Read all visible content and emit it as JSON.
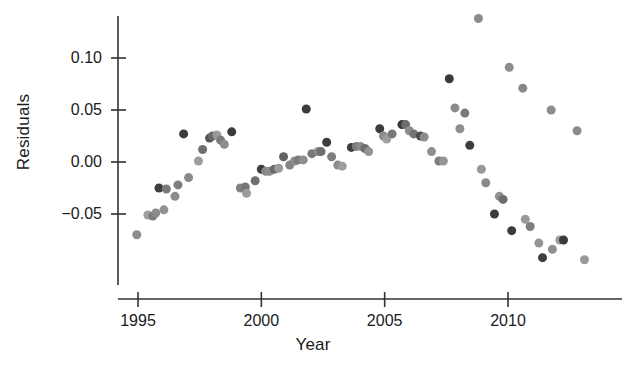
{
  "chart_data": {
    "type": "scatter",
    "title": "",
    "xlabel": "Year",
    "ylabel": "Residuals",
    "xlim": [
      1994.6,
      2013.7
    ],
    "ylim": [
      -0.098,
      0.145
    ],
    "grid": false,
    "legend": null,
    "xticks": [
      1995,
      2000,
      2005,
      2010
    ],
    "xtick_labels": [
      "1995",
      "2000",
      "2005",
      "2010"
    ],
    "yticks": [
      0.1,
      0.05,
      0.0,
      -0.05
    ],
    "ytick_labels": [
      "0.10",
      "0.05",
      "0.00",
      "-0.05"
    ],
    "marker": "circle",
    "marker_size_px": 9,
    "point_colors": [
      "#3b3b3b",
      "#6e6e6e",
      "#9a9a9a"
    ],
    "points": [
      {
        "x": 1994.95,
        "y": -0.07,
        "c": "#8d8d8d"
      },
      {
        "x": 1995.4,
        "y": -0.051,
        "c": "#9e9e9e"
      },
      {
        "x": 1995.6,
        "y": -0.052,
        "c": "#7d7d7d"
      },
      {
        "x": 1995.72,
        "y": -0.049,
        "c": "#8a8a8a"
      },
      {
        "x": 1996.05,
        "y": -0.046,
        "c": "#919191"
      },
      {
        "x": 1995.85,
        "y": -0.025,
        "c": "#3e3e3e"
      },
      {
        "x": 1996.15,
        "y": -0.026,
        "c": "#7a7a7a"
      },
      {
        "x": 1996.5,
        "y": -0.033,
        "c": "#8c8c8c"
      },
      {
        "x": 1996.62,
        "y": -0.022,
        "c": "#7d7d7d"
      },
      {
        "x": 1996.85,
        "y": 0.027,
        "c": "#3b3b3b"
      },
      {
        "x": 1997.05,
        "y": -0.015,
        "c": "#8a8a8a"
      },
      {
        "x": 1997.45,
        "y": 0.001,
        "c": "#9c9c9c"
      },
      {
        "x": 1997.62,
        "y": 0.012,
        "c": "#6f6f6f"
      },
      {
        "x": 1997.9,
        "y": 0.023,
        "c": "#555555"
      },
      {
        "x": 1998.02,
        "y": 0.025,
        "c": "#6a6a6a"
      },
      {
        "x": 1998.2,
        "y": 0.026,
        "c": "#9a9a9a"
      },
      {
        "x": 1998.35,
        "y": 0.021,
        "c": "#7b7b7b"
      },
      {
        "x": 1998.5,
        "y": 0.017,
        "c": "#8e8e8e"
      },
      {
        "x": 1998.8,
        "y": 0.029,
        "c": "#3c3c3c"
      },
      {
        "x": 1999.15,
        "y": -0.025,
        "c": "#828282"
      },
      {
        "x": 1999.35,
        "y": -0.024,
        "c": "#767676"
      },
      {
        "x": 1999.4,
        "y": -0.03,
        "c": "#9c9c9c"
      },
      {
        "x": 1999.75,
        "y": -0.018,
        "c": "#6e6e6e"
      },
      {
        "x": 2000.0,
        "y": -0.007,
        "c": "#3f3f3f"
      },
      {
        "x": 2000.18,
        "y": -0.009,
        "c": "#888888"
      },
      {
        "x": 2000.33,
        "y": -0.009,
        "c": "#8e8e8e"
      },
      {
        "x": 2000.52,
        "y": -0.007,
        "c": "#6a6a6a"
      },
      {
        "x": 2000.7,
        "y": -0.006,
        "c": "#9a9a9a"
      },
      {
        "x": 2000.9,
        "y": 0.005,
        "c": "#636363"
      },
      {
        "x": 2001.15,
        "y": -0.003,
        "c": "#848484"
      },
      {
        "x": 2001.35,
        "y": 0.001,
        "c": "#8d8d8d"
      },
      {
        "x": 2001.5,
        "y": 0.002,
        "c": "#7c7c7c"
      },
      {
        "x": 2001.7,
        "y": 0.002,
        "c": "#8f8f8f"
      },
      {
        "x": 2001.82,
        "y": 0.051,
        "c": "#3b3b3b"
      },
      {
        "x": 2002.05,
        "y": 0.008,
        "c": "#797979"
      },
      {
        "x": 2002.3,
        "y": 0.01,
        "c": "#8a8a8a"
      },
      {
        "x": 2002.42,
        "y": 0.01,
        "c": "#707070"
      },
      {
        "x": 2002.65,
        "y": 0.019,
        "c": "#3e3e3e"
      },
      {
        "x": 2002.85,
        "y": 0.005,
        "c": "#7f7f7f"
      },
      {
        "x": 2003.1,
        "y": -0.003,
        "c": "#8b8b8b"
      },
      {
        "x": 2003.28,
        "y": -0.004,
        "c": "#9d9d9d"
      },
      {
        "x": 2003.65,
        "y": 0.014,
        "c": "#3d3d3d"
      },
      {
        "x": 2003.85,
        "y": 0.015,
        "c": "#7b7b7b"
      },
      {
        "x": 2004.02,
        "y": 0.015,
        "c": "#8c8c8c"
      },
      {
        "x": 2004.2,
        "y": 0.013,
        "c": "#6d6d6d"
      },
      {
        "x": 2004.35,
        "y": 0.01,
        "c": "#949494"
      },
      {
        "x": 2004.8,
        "y": 0.032,
        "c": "#3c3c3c"
      },
      {
        "x": 2004.95,
        "y": 0.025,
        "c": "#8b8b8b"
      },
      {
        "x": 2005.08,
        "y": 0.022,
        "c": "#9e9e9e"
      },
      {
        "x": 2005.3,
        "y": 0.027,
        "c": "#787878"
      },
      {
        "x": 2005.7,
        "y": 0.036,
        "c": "#3b3b3b"
      },
      {
        "x": 2005.85,
        "y": 0.036,
        "c": "#6b6b6b"
      },
      {
        "x": 2006.0,
        "y": 0.03,
        "c": "#8d8d8d"
      },
      {
        "x": 2006.18,
        "y": 0.027,
        "c": "#747474"
      },
      {
        "x": 2006.45,
        "y": 0.025,
        "c": "#4c4c4c"
      },
      {
        "x": 2006.6,
        "y": 0.024,
        "c": "#8a8a8a"
      },
      {
        "x": 2006.9,
        "y": 0.01,
        "c": "#8f8f8f"
      },
      {
        "x": 2007.2,
        "y": 0.001,
        "c": "#7c7c7c"
      },
      {
        "x": 2007.38,
        "y": 0.001,
        "c": "#949494"
      },
      {
        "x": 2007.62,
        "y": 0.08,
        "c": "#3a3a3a"
      },
      {
        "x": 2007.85,
        "y": 0.052,
        "c": "#8b8b8b"
      },
      {
        "x": 2008.05,
        "y": 0.032,
        "c": "#8e8e8e"
      },
      {
        "x": 2008.25,
        "y": 0.047,
        "c": "#7a7a7a"
      },
      {
        "x": 2008.45,
        "y": 0.016,
        "c": "#3d3d3d"
      },
      {
        "x": 2008.8,
        "y": 0.138,
        "c": "#8c8c8c"
      },
      {
        "x": 2008.92,
        "y": -0.007,
        "c": "#989898"
      },
      {
        "x": 2009.1,
        "y": -0.02,
        "c": "#8a8a8a"
      },
      {
        "x": 2009.45,
        "y": -0.05,
        "c": "#3c3c3c"
      },
      {
        "x": 2009.65,
        "y": -0.033,
        "c": "#8f8f8f"
      },
      {
        "x": 2009.8,
        "y": -0.036,
        "c": "#6d6d6d"
      },
      {
        "x": 2010.05,
        "y": 0.091,
        "c": "#8d8d8d"
      },
      {
        "x": 2010.15,
        "y": -0.066,
        "c": "#3b3b3b"
      },
      {
        "x": 2010.6,
        "y": 0.071,
        "c": "#888888"
      },
      {
        "x": 2010.7,
        "y": -0.055,
        "c": "#9b9b9b"
      },
      {
        "x": 2010.9,
        "y": -0.062,
        "c": "#7e7e7e"
      },
      {
        "x": 2011.25,
        "y": -0.078,
        "c": "#949494"
      },
      {
        "x": 2011.4,
        "y": -0.092,
        "c": "#3d3d3d"
      },
      {
        "x": 2011.75,
        "y": 0.05,
        "c": "#8c8c8c"
      },
      {
        "x": 2011.8,
        "y": -0.084,
        "c": "#8f8f8f"
      },
      {
        "x": 2012.1,
        "y": -0.075,
        "c": "#9d9d9d"
      },
      {
        "x": 2012.25,
        "y": -0.075,
        "c": "#3b3b3b"
      },
      {
        "x": 2012.8,
        "y": 0.03,
        "c": "#8a8a8a"
      },
      {
        "x": 2013.1,
        "y": -0.094,
        "c": "#999999"
      }
    ]
  },
  "axes": {
    "x_label_text": "Year",
    "y_label_text": "Residuals"
  }
}
